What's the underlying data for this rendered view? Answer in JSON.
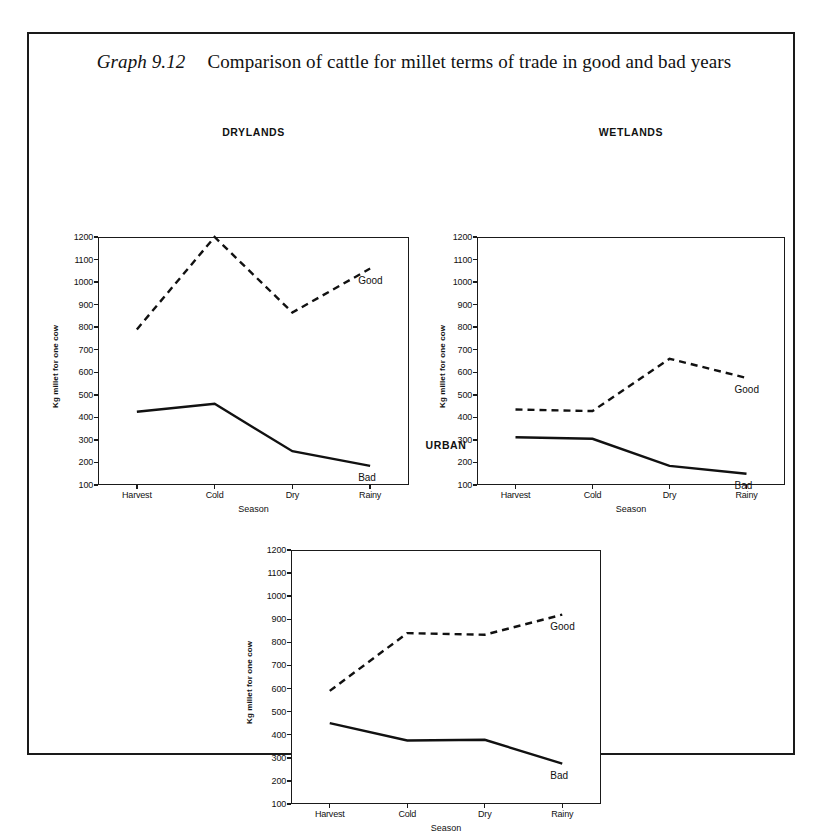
{
  "figure": {
    "label": "Graph 9.12",
    "caption": "Comparison of cattle for millet terms of trade in good and bad years"
  },
  "axis": {
    "ylabel": "Kg millet for one cow",
    "xlabel": "Season",
    "yticks": [
      "1200",
      "1100",
      "1000",
      "900",
      "800",
      "700",
      "600",
      "500",
      "400",
      "300",
      "200",
      "100"
    ],
    "xticks": [
      "Harvest",
      "Cold",
      "Dry",
      "Rainy"
    ]
  },
  "series_labels": {
    "good": "Good",
    "bad": "Bad"
  },
  "chart_data": [
    {
      "type": "line",
      "title": "DRYLANDS",
      "xlabel": "Season",
      "ylabel": "Kg millet for one cow",
      "categories": [
        "Harvest",
        "Cold",
        "Dry",
        "Rainy"
      ],
      "ylim": [
        100,
        1200
      ],
      "ytick_step": 100,
      "grid": false,
      "legend": "inline-right",
      "series": [
        {
          "name": "Good",
          "style": "dashed",
          "values": [
            790,
            1200,
            865,
            1060
          ]
        },
        {
          "name": "Bad",
          "style": "solid",
          "values": [
            425,
            460,
            250,
            185
          ]
        }
      ]
    },
    {
      "type": "line",
      "title": "WETLANDS",
      "xlabel": "Season",
      "ylabel": "Kg millet for one cow",
      "categories": [
        "Harvest",
        "Cold",
        "Dry",
        "Rainy"
      ],
      "ylim": [
        100,
        1200
      ],
      "ytick_step": 100,
      "grid": false,
      "legend": "inline-right",
      "series": [
        {
          "name": "Good",
          "style": "dashed",
          "values": [
            435,
            428,
            660,
            575
          ]
        },
        {
          "name": "Bad",
          "style": "solid",
          "values": [
            312,
            305,
            185,
            150
          ]
        }
      ]
    },
    {
      "type": "line",
      "title": "URBAN",
      "xlabel": "Season",
      "ylabel": "Kg millet for one cow",
      "categories": [
        "Harvest",
        "Cold",
        "Dry",
        "Rainy"
      ],
      "ylim": [
        100,
        1200
      ],
      "ytick_step": 100,
      "grid": false,
      "legend": "inline-right",
      "series": [
        {
          "name": "Good",
          "style": "dashed",
          "values": [
            590,
            840,
            833,
            920
          ]
        },
        {
          "name": "Bad",
          "style": "solid",
          "values": [
            450,
            375,
            378,
            275
          ]
        }
      ]
    }
  ],
  "layout": {
    "charts": [
      {
        "key": "drylands",
        "left": 18,
        "top": 92,
        "plot_left": 51,
        "plot_top": 111,
        "plot_w": 311,
        "plot_h": 248
      },
      {
        "key": "wetlands",
        "left": 405,
        "top": 92,
        "plot_left": 43,
        "plot_top": 111,
        "plot_w": 308,
        "plot_h": 248
      },
      {
        "key": "urban",
        "left": 212,
        "top": 405,
        "plot_left": 50,
        "plot_top": 111,
        "plot_w": 310,
        "plot_h": 254
      }
    ]
  }
}
